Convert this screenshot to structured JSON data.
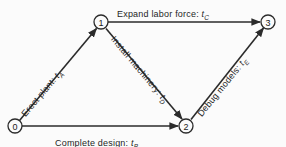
{
  "diagram": {
    "type": "activity-network",
    "title": "",
    "background_color": "#fbfbfb",
    "line_color": "#2b2b2b",
    "nodes": [
      {
        "id": "0",
        "label": "0",
        "x": 15,
        "y": 126
      },
      {
        "id": "1",
        "label": "1",
        "x": 101,
        "y": 22
      },
      {
        "id": "2",
        "label": "2",
        "x": 186,
        "y": 126
      },
      {
        "id": "3",
        "label": "3",
        "x": 268,
        "y": 22
      }
    ],
    "edges": [
      {
        "from": "0",
        "to": "1",
        "activity": "Erect plant",
        "separator": ":",
        "duration_var": "t",
        "duration_sub": "A",
        "full_label": "Erect plant: tA"
      },
      {
        "from": "0",
        "to": "2",
        "activity": "Complete design",
        "separator": ":",
        "duration_var": "t",
        "duration_sub": "B",
        "full_label": "Complete design: tB"
      },
      {
        "from": "1",
        "to": "3",
        "activity": "Expand labor force",
        "separator": ":",
        "duration_var": "t",
        "duration_sub": "C",
        "full_label": "Expand labor force: tC"
      },
      {
        "from": "1",
        "to": "2",
        "activity": "Install machinery",
        "separator": ":",
        "duration_var": "t",
        "duration_sub": "D",
        "full_label": "Install machinery: tD"
      },
      {
        "from": "2",
        "to": "3",
        "activity": "Debug models",
        "separator": ":",
        "duration_var": "t",
        "duration_sub": "E",
        "full_label": "Debug models: tE"
      }
    ]
  }
}
